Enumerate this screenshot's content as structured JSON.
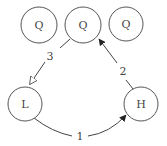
{
  "diagram": {
    "type": "state-graph",
    "nodes": [
      {
        "id": "q1",
        "label": "Q"
      },
      {
        "id": "q2",
        "label": "Q"
      },
      {
        "id": "q3",
        "label": "Q"
      },
      {
        "id": "l",
        "label": "L"
      },
      {
        "id": "h",
        "label": "H"
      }
    ],
    "edges": [
      {
        "id": "e1",
        "from": "l",
        "to": "h",
        "label": "1",
        "arrowhead": "filled"
      },
      {
        "id": "e2",
        "from": "h",
        "to": "q2",
        "label": "2",
        "arrowhead": "filled"
      },
      {
        "id": "e3",
        "from": "q2",
        "to": "l",
        "label": "3",
        "arrowhead": "hollow"
      }
    ],
    "colors": {
      "stroke": "#555555",
      "text": "#444444",
      "background": "#ffffff"
    }
  }
}
